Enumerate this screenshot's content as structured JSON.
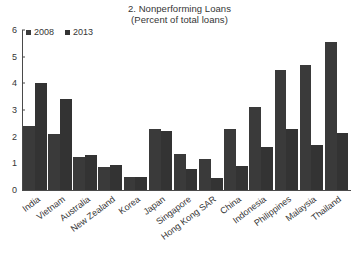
{
  "chart_data": {
    "type": "bar",
    "title": "2. Nonperforming Loans",
    "subtitle": "(Percent of total loans)",
    "xlabel": "",
    "ylabel": "",
    "ylim": [
      0,
      6
    ],
    "yticks": [
      0,
      1,
      2,
      3,
      4,
      5,
      6
    ],
    "grid": false,
    "legend_position": "top-left",
    "categories": [
      "India",
      "Vietnam",
      "Australia",
      "New Zealand",
      "Korea",
      "Japan",
      "Singapore",
      "Hong Kong SAR",
      "China",
      "Indonesia",
      "Philippines",
      "Malaysia",
      "Thailand"
    ],
    "series": [
      {
        "name": "2008",
        "color": "#3a3a3a",
        "values": [
          2.4,
          2.1,
          1.22,
          0.85,
          0.5,
          2.3,
          1.35,
          1.15,
          2.28,
          3.1,
          4.5,
          4.68,
          5.55
        ]
      },
      {
        "name": "2013",
        "color": "#333333",
        "values": [
          4.0,
          3.4,
          1.32,
          0.94,
          0.5,
          2.2,
          0.8,
          0.45,
          0.9,
          1.6,
          2.3,
          1.7,
          2.15
        ]
      }
    ]
  },
  "axis": {
    "y_tick_labels": [
      "6",
      "5",
      "4",
      "3",
      "2",
      "1",
      "0"
    ]
  },
  "legend": {
    "items": [
      {
        "label": "2008",
        "color": "#3a3a3a"
      },
      {
        "label": "2013",
        "color": "#333333"
      }
    ]
  },
  "footer": {
    "ghost_text": ""
  }
}
